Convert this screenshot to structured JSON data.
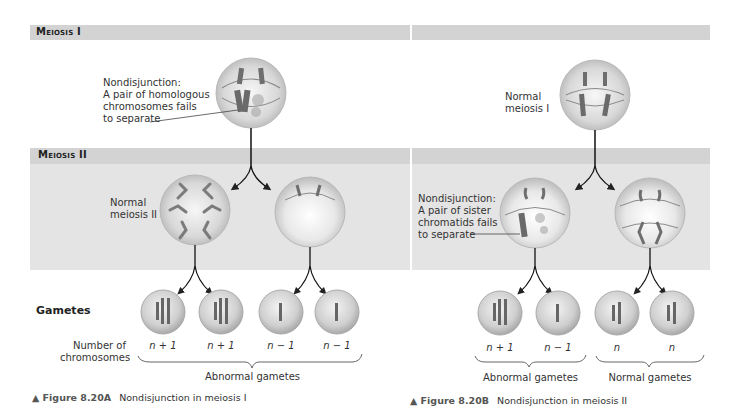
{
  "bands": {
    "meiosis1_label": "Meiosis I",
    "meiosis2_label": "Meiosis II"
  },
  "panelA": {
    "top_annotation": [
      "Nondisjunction:",
      "A pair of homologous",
      "chromosomes fails",
      "to separate"
    ],
    "middle_annotation": [
      "Normal",
      "meiosis II"
    ],
    "gametes_title": "Gametes",
    "count_label": [
      "Number of",
      "chromosomes"
    ],
    "gamete_counts": [
      "n + 1",
      "n + 1",
      "n − 1",
      "n − 1"
    ],
    "group_label": "Abnormal gametes",
    "caption_fig": "▲ Figure 8.20A",
    "caption_text": "Nondisjunction in meiosis I"
  },
  "panelB": {
    "top_annotation": [
      "Normal",
      "meiosis I"
    ],
    "middle_annotation": [
      "Nondisjunction:",
      "A pair of sister",
      "chromatids fails",
      "to separate"
    ],
    "gamete_counts": [
      "n + 1",
      "n − 1",
      "n",
      "n"
    ],
    "group_labels": [
      "Abnormal gametes",
      "Normal gametes"
    ],
    "caption_fig": "▲ Figure 8.20B",
    "caption_text": "Nondisjunction in meiosis II"
  },
  "colors": {
    "band": "#d3d3d3",
    "zone": "#e4e4e4",
    "cell_edge": "#b9b9b9",
    "chromosome": "#6e6e6e"
  }
}
